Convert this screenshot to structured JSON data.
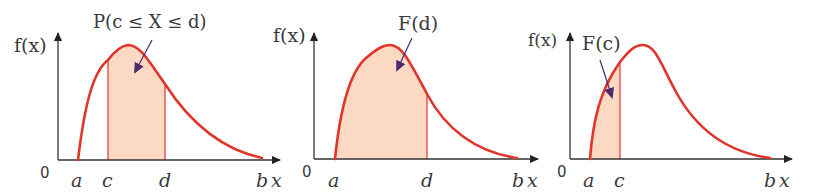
{
  "colors": {
    "curve": "#e0352b",
    "fill": "#fbd9c2",
    "axis": "#333333",
    "arrow": "#4b2a6e",
    "text": "#3a3a3a"
  },
  "panels": [
    {
      "id": "probability-between",
      "y_axis_label": "f(x)",
      "x_axis_label": "x",
      "origin_label": "0",
      "annotation": "P(c ≤ X ≤ d)",
      "ticks": [
        {
          "label": "a"
        },
        {
          "label": "c"
        },
        {
          "label": "d"
        },
        {
          "label": "b"
        }
      ],
      "shaded_region": "c to d"
    },
    {
      "id": "cdf-at-d",
      "y_axis_label": "f(x)",
      "x_axis_label": "x",
      "origin_label": "0",
      "annotation": "F(d)",
      "ticks": [
        {
          "label": "a"
        },
        {
          "label": "d"
        },
        {
          "label": "b"
        }
      ],
      "shaded_region": "a to d"
    },
    {
      "id": "cdf-at-c",
      "y_axis_label": "f(x)",
      "x_axis_label": "x",
      "origin_label": "0",
      "annotation": "F(c)",
      "ticks": [
        {
          "label": "a"
        },
        {
          "label": "c"
        },
        {
          "label": "b"
        }
      ],
      "shaded_region": "a to c"
    }
  ]
}
